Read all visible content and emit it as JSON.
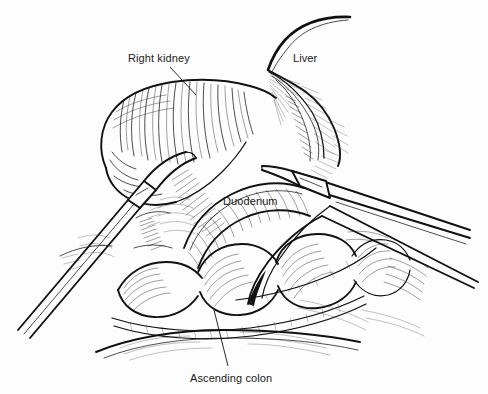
{
  "figure": {
    "kind": "medical-line-illustration",
    "width": 488,
    "height": 394,
    "background_color": "#fdfdfd",
    "ink_color": "#111111"
  },
  "labels": [
    {
      "id": "right-kidney",
      "text": "Right kidney",
      "x": 128,
      "y": 62,
      "leader": {
        "x1": 170,
        "y1": 67,
        "x2": 196,
        "y2": 95
      }
    },
    {
      "id": "liver",
      "text": "Liver",
      "x": 293,
      "y": 62,
      "leader": null
    },
    {
      "id": "duodenum",
      "text": "Duodenum",
      "x": 223,
      "y": 205,
      "leader": null
    },
    {
      "id": "ascending-colon",
      "text": "Ascending colon",
      "x": 190,
      "y": 382,
      "leader": {
        "x1": 228,
        "y1": 366,
        "x2": 214,
        "y2": 310
      }
    }
  ],
  "anatomy": [
    {
      "id": "right-kidney-body",
      "name": "Right kidney"
    },
    {
      "id": "liver-lobe",
      "name": "Liver"
    },
    {
      "id": "duodenum-loop",
      "name": "Duodenum"
    },
    {
      "id": "ascending-colon-haustra",
      "name": "Ascending colon"
    },
    {
      "id": "retroperitoneal-fat",
      "name": "Retroperitoneal fat and fascia"
    }
  ],
  "instruments": [
    {
      "id": "left-grasper",
      "name": "Laparoscopic grasper (left)"
    },
    {
      "id": "right-dissector",
      "name": "Laparoscopic dissector (right)"
    },
    {
      "id": "right-hook-probe",
      "name": "Fine hook probe (right)"
    }
  ]
}
